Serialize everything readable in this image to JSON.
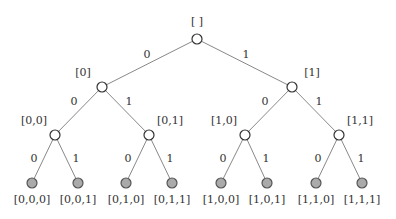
{
  "diagram": {
    "type": "binary-tree",
    "colors": {
      "edge": "#888888",
      "internal_fill": "#ffffff",
      "internal_stroke": "#333333",
      "leaf_fill": "#aaaaaa",
      "leaf_stroke": "#555555",
      "text": "#333333"
    },
    "nodes": [
      {
        "id": "root",
        "label": "[ ]",
        "x": 197,
        "y": 39,
        "leaf": false,
        "lx": 197,
        "ly": 25,
        "anchor": "middle"
      },
      {
        "id": "n0",
        "label": "[0]",
        "x": 102,
        "y": 87,
        "leaf": false,
        "lx": 83,
        "ly": 76,
        "anchor": "middle"
      },
      {
        "id": "n1",
        "label": "[1]",
        "x": 292,
        "y": 87,
        "leaf": false,
        "lx": 312,
        "ly": 76,
        "anchor": "middle"
      },
      {
        "id": "n00",
        "label": "[0,0]",
        "x": 55,
        "y": 135,
        "leaf": false,
        "lx": 34,
        "ly": 124,
        "anchor": "middle"
      },
      {
        "id": "n01",
        "label": "[0,1]",
        "x": 149,
        "y": 135,
        "leaf": false,
        "lx": 170,
        "ly": 124,
        "anchor": "middle"
      },
      {
        "id": "n10",
        "label": "[1,0]",
        "x": 245,
        "y": 135,
        "leaf": false,
        "lx": 224,
        "ly": 124,
        "anchor": "middle"
      },
      {
        "id": "n11",
        "label": "[1,1]",
        "x": 339,
        "y": 135,
        "leaf": false,
        "lx": 360,
        "ly": 124,
        "anchor": "middle"
      },
      {
        "id": "n000",
        "label": "[0,0,0]",
        "x": 32,
        "y": 183,
        "leaf": true,
        "lx": 32,
        "ly": 203,
        "anchor": "middle"
      },
      {
        "id": "n001",
        "label": "[0,0,1]",
        "x": 78,
        "y": 183,
        "leaf": true,
        "lx": 78,
        "ly": 203,
        "anchor": "middle"
      },
      {
        "id": "n010",
        "label": "[0,1,0]",
        "x": 126,
        "y": 183,
        "leaf": true,
        "lx": 126,
        "ly": 203,
        "anchor": "middle"
      },
      {
        "id": "n011",
        "label": "[0,1,1]",
        "x": 172,
        "y": 183,
        "leaf": true,
        "lx": 172,
        "ly": 203,
        "anchor": "middle"
      },
      {
        "id": "n100",
        "label": "[1,0,0]",
        "x": 221,
        "y": 183,
        "leaf": true,
        "lx": 221,
        "ly": 203,
        "anchor": "middle"
      },
      {
        "id": "n101",
        "label": "[1,0,1]",
        "x": 267,
        "y": 183,
        "leaf": true,
        "lx": 267,
        "ly": 203,
        "anchor": "middle"
      },
      {
        "id": "n110",
        "label": "[1,1,0]",
        "x": 316,
        "y": 183,
        "leaf": true,
        "lx": 316,
        "ly": 203,
        "anchor": "middle"
      },
      {
        "id": "n111",
        "label": "[1,1,1]",
        "x": 362,
        "y": 183,
        "leaf": true,
        "lx": 362,
        "ly": 203,
        "anchor": "middle"
      }
    ],
    "edges": [
      {
        "from": "root",
        "to": "n0",
        "label": "0",
        "lx": 147,
        "ly": 58
      },
      {
        "from": "root",
        "to": "n1",
        "label": "1",
        "lx": 246,
        "ly": 58
      },
      {
        "from": "n0",
        "to": "n00",
        "label": "0",
        "lx": 74,
        "ly": 105
      },
      {
        "from": "n0",
        "to": "n01",
        "label": "1",
        "lx": 129,
        "ly": 105
      },
      {
        "from": "n1",
        "to": "n10",
        "label": "0",
        "lx": 265,
        "ly": 105
      },
      {
        "from": "n1",
        "to": "n11",
        "label": "1",
        "lx": 319,
        "ly": 105
      },
      {
        "from": "n00",
        "to": "n000",
        "label": "0",
        "lx": 34,
        "ly": 162
      },
      {
        "from": "n00",
        "to": "n001",
        "label": "1",
        "lx": 76,
        "ly": 162
      },
      {
        "from": "n01",
        "to": "n010",
        "label": "0",
        "lx": 128,
        "ly": 162
      },
      {
        "from": "n01",
        "to": "n011",
        "label": "1",
        "lx": 170,
        "ly": 162
      },
      {
        "from": "n10",
        "to": "n100",
        "label": "0",
        "lx": 223,
        "ly": 162
      },
      {
        "from": "n10",
        "to": "n101",
        "label": "1",
        "lx": 266,
        "ly": 162
      },
      {
        "from": "n11",
        "to": "n110",
        "label": "0",
        "lx": 318,
        "ly": 162
      },
      {
        "from": "n11",
        "to": "n111",
        "label": "1",
        "lx": 361,
        "ly": 162
      }
    ]
  }
}
